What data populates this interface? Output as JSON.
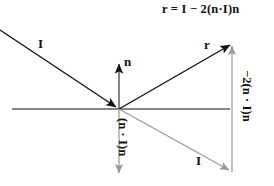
{
  "figure": {
    "formula": "r = I − 2(n·I)n",
    "background_color": "#ffffff",
    "stroke_color": "#111111",
    "muted_stroke_color": "#9a9a9a",
    "labels": {
      "incident_top": "I",
      "normal": "n",
      "reflected": "r",
      "incident_bottom": "I",
      "projection": "(n · I)n",
      "minus_two_projection": "−2(n · I)n"
    },
    "icon_names": {
      "incident_arrow": "incident-ray-arrow-icon",
      "normal_arrow": "normal-vector-arrow-icon",
      "reflected_arrow": "reflected-ray-arrow-icon",
      "transmitted_arrow": "incident-continuation-arrow-icon",
      "projection_arrow": "projection-vector-arrow-icon",
      "offset_arrow": "offset-vector-arrow-icon",
      "surface_line": "surface-line-icon"
    },
    "geometry": {
      "origin_x": 119,
      "origin_y": 109,
      "surface_line_x1": 12,
      "surface_line_x2": 230,
      "normal_tip_y": 62,
      "reflected_tip_x": 232,
      "reflected_tip_y": 44,
      "continuation_tip_x": 231,
      "continuation_tip_y": 172,
      "projection_tip_y": 176,
      "offset_line_x": 232
    }
  }
}
